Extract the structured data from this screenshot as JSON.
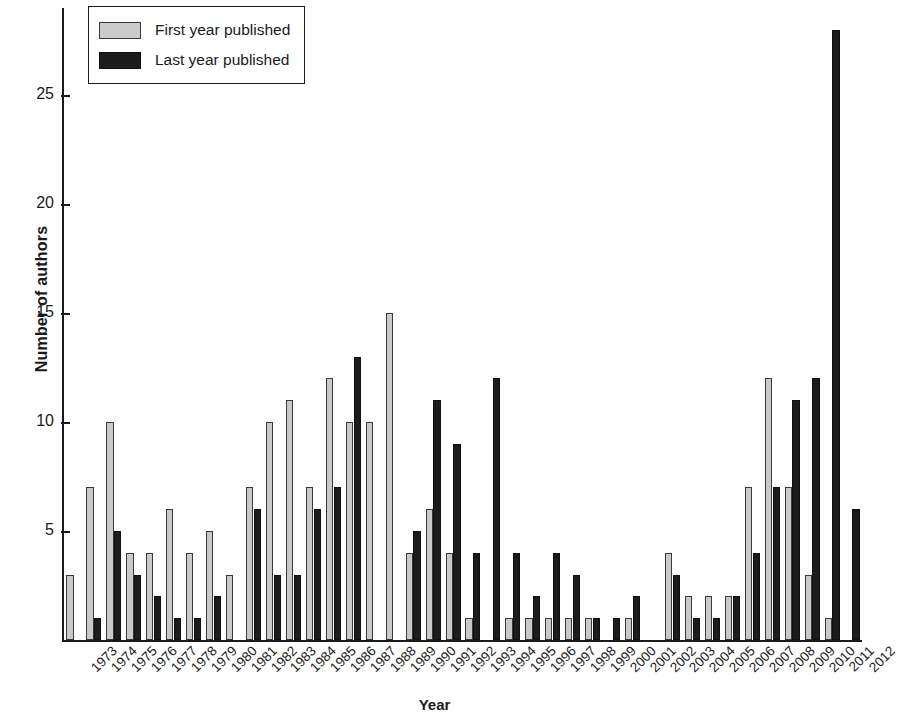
{
  "chart_data": {
    "type": "bar",
    "title": "",
    "xlabel": "Year",
    "ylabel": "Number of authors",
    "ylim": [
      0,
      29
    ],
    "yticks": [
      5,
      10,
      15,
      20,
      25
    ],
    "grid": false,
    "legend_position": "top-left",
    "categories": [
      "1973",
      "1974",
      "1975",
      "1976",
      "1977",
      "1978",
      "1979",
      "1980",
      "1981",
      "1982",
      "1983",
      "1984",
      "1985",
      "1986",
      "1987",
      "1988",
      "1989",
      "1990",
      "1991",
      "1992",
      "1993",
      "1994",
      "1995",
      "1996",
      "1997",
      "1998",
      "1999",
      "2000",
      "2001",
      "2002",
      "2003",
      "2004",
      "2005",
      "2006",
      "2007",
      "2008",
      "2009",
      "2010",
      "2011",
      "2012"
    ],
    "series": [
      {
        "name": "First year published",
        "color": "#c9c9c9",
        "values": [
          3,
          7,
          10,
          4,
          4,
          6,
          4,
          5,
          3,
          7,
          10,
          11,
          7,
          12,
          10,
          10,
          15,
          4,
          6,
          4,
          1,
          0,
          1,
          1,
          1,
          1,
          1,
          0,
          1,
          0,
          4,
          2,
          2,
          2,
          7,
          12,
          7,
          3,
          1,
          0
        ]
      },
      {
        "name": "Last year published",
        "color": "#1c1c1c",
        "values": [
          0,
          1,
          5,
          3,
          2,
          1,
          1,
          2,
          0,
          6,
          3,
          3,
          6,
          7,
          13,
          0,
          0,
          5,
          11,
          9,
          4,
          12,
          4,
          2,
          4,
          3,
          1,
          1,
          2,
          0,
          3,
          1,
          1,
          2,
          4,
          7,
          11,
          12,
          28,
          6
        ]
      }
    ]
  },
  "legend": {
    "items": [
      {
        "label": "First year published",
        "swatch": "first"
      },
      {
        "label": "Last year published",
        "swatch": "last"
      }
    ]
  },
  "axes": {
    "y_title": "Number of authors",
    "x_title": "Year"
  }
}
